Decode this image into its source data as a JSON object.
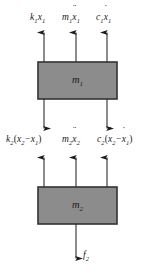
{
  "figure": {
    "type": "free-body-diagram",
    "background_color": "#ffffff",
    "block_fill_color": "#8c8c8c",
    "block_border_color": "#333333",
    "arrow_color": "#1a1a1a",
    "text_color": "#1a1a1a"
  },
  "blocks": [
    {
      "id": "mass-1",
      "label_base": "m",
      "label_sub": "1",
      "x": 38,
      "y": 62,
      "width": 79,
      "height": 37
    },
    {
      "id": "mass-2",
      "label_base": "m",
      "label_sub": "2",
      "x": 38,
      "y": 187,
      "width": 79,
      "height": 37
    }
  ],
  "forces": {
    "top_of_mass1": [
      {
        "id": "spring-force-1",
        "symbol_base": "k",
        "symbol_sub": "1",
        "operand": "x",
        "operand_sub": "1",
        "text": "k1x1",
        "direction": "up",
        "arrow_x": 44,
        "label_x": 30,
        "label_y": 15
      },
      {
        "id": "inertia-force-1",
        "symbol_base": "m",
        "symbol_sub": "1",
        "operand": "x",
        "operand_sub": "1",
        "dots": "2",
        "text": "m1x1ddot",
        "direction": "up",
        "arrow_x": 76,
        "label_x": 62,
        "label_y": 15
      },
      {
        "id": "damper-force-1",
        "symbol_base": "c",
        "symbol_sub": "1",
        "operand": "x",
        "operand_sub": "1",
        "dots": "1",
        "text": "c1x1dot",
        "direction": "up",
        "arrow_x": 107,
        "label_x": 95,
        "label_y": 15
      }
    ],
    "between_masses": [
      {
        "id": "spring-force-2",
        "symbol_base": "k",
        "symbol_sub": "2",
        "text": "k2(x2-x1)",
        "direction_top": "down",
        "direction_bottom": "up",
        "arrow_x": 44,
        "label_x": 6,
        "label_y": 137
      },
      {
        "id": "inertia-force-2",
        "symbol_base": "m",
        "symbol_sub": "2",
        "text": "m2x2ddot",
        "direction_bottom": "up",
        "arrow_x": 76,
        "label_x": 62,
        "label_y": 137
      },
      {
        "id": "damper-force-2",
        "symbol_base": "c",
        "symbol_sub": "2",
        "text": "c2(x2dot-x1dot)",
        "direction_top": "down",
        "direction_bottom": "up",
        "arrow_x": 107,
        "label_x": 97,
        "label_y": 137
      }
    ],
    "bottom_of_mass2": [
      {
        "id": "external-force-2",
        "symbol_base": "f",
        "symbol_sub": "2",
        "text": "f2",
        "direction": "down",
        "arrow_x": 76,
        "label_x": 83,
        "label_y": 255
      }
    ]
  },
  "labels": {
    "k1x1": {
      "base": "k",
      "sub1": "1",
      "var": "x",
      "sub2": "1"
    },
    "m1x1ddot": {
      "base": "m",
      "sub1": "1",
      "var": "x",
      "sub2": "1",
      "dots": "¨"
    },
    "c1x1dot": {
      "base": "c",
      "sub1": "1",
      "var": "x",
      "sub2": "1",
      "dots": "˙"
    },
    "k2": {
      "base": "k",
      "sub1": "2"
    },
    "m2": {
      "base": "m",
      "sub1": "2"
    },
    "c2": {
      "base": "c",
      "sub1": "2"
    },
    "x2": {
      "var": "x",
      "sub": "2"
    },
    "x1": {
      "var": "x",
      "sub": "1"
    },
    "f2": {
      "base": "f",
      "sub1": "2"
    },
    "open_paren": "(",
    "close_paren": ")",
    "minus": "−",
    "dot_single": "˙",
    "dot_double": "¨"
  }
}
